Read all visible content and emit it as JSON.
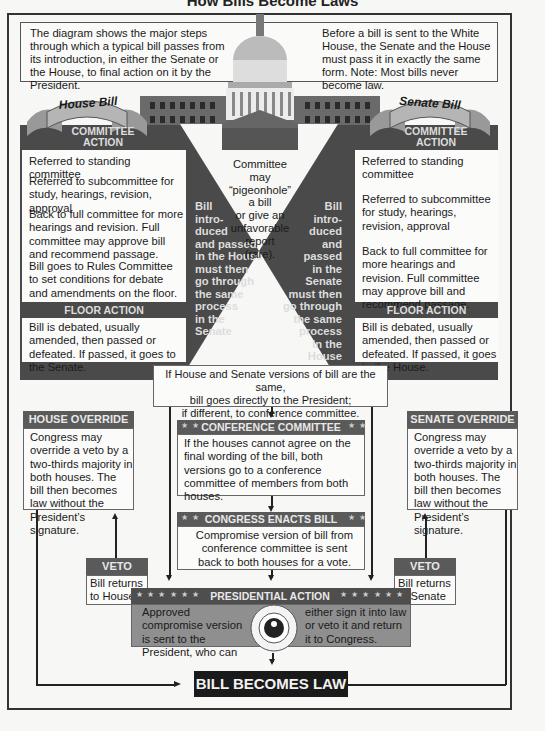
{
  "title": "How Bills Become Laws",
  "intro": {
    "left": "The diagram shows the major steps through which a typical bill passes from its introduction, in either the Senate or the House, to final action on it by the President.",
    "right": "Before a bill is sent to the White House, the Senate and the House must pass it in exactly the same form. Note: Most bills never become law."
  },
  "house": {
    "banner": "House Bill",
    "committee_header_1": "COMMITTEE",
    "committee_header_2": "ACTION",
    "steps": [
      "Referred to standing committee",
      "Referred to subcommittee for study, hearings, revision, approval",
      "Back to full committee for more hearings and revision. Full committee may approve bill and recommend passage.",
      "Bill goes to Rules Committee to set conditions for debate and amendments on the floor."
    ],
    "floor_header": "FLOOR ACTION",
    "floor_text": "Bill is debated, usually amended, then passed or defeated. If passed, it goes to the Senate.",
    "side_lines": [
      "Bill",
      "intro-",
      "duced",
      "and passed",
      "in the House",
      "must then",
      "go through",
      "the same",
      "process",
      "in the",
      "Senate"
    ]
  },
  "senate": {
    "banner": "Senate Bill",
    "committee_header_1": "COMMITTEE",
    "committee_header_2": "ACTION",
    "steps": [
      "Referred to standing committee",
      "Referred to subcommittee for study, hearings, revision, approval",
      "Back to full committee for more hearings and revision. Full committee may approve bill and recommend passage."
    ],
    "floor_header": "FLOOR ACTION",
    "floor_text": "Bill is debated, usually amended, then passed or defeated. If passed, it goes to the House.",
    "side_lines": [
      "Bill",
      "intro-",
      "duced",
      "and passed",
      "in the Senate",
      "must then",
      "go through",
      "the same",
      "process",
      "in the",
      "House"
    ]
  },
  "pigeonhole": [
    "Committee may",
    "“pigeonhole” a bill",
    "or give an",
    "unfavorable",
    "report",
    "(rare)."
  ],
  "versions_note": [
    "If House and Senate versions of bill are the same,",
    "bill goes directly to the President;",
    "if different, to conference committee."
  ],
  "conference": {
    "header": "CONFERENCE COMMITTEE",
    "stars": "★ ★",
    "text": "If the houses cannot agree on the final wording of the bill, both versions go to a conference committee of members from both houses."
  },
  "enacts": {
    "header": "CONGRESS ENACTS BILL",
    "stars": "★ ★",
    "text": "Compromise version of bill from conference committee is sent back to both houses for a vote."
  },
  "house_override": {
    "header": "HOUSE OVERRIDE",
    "text": "Congress may override a veto by a two-thirds majority in both houses. The bill then becomes law without the President’s signature."
  },
  "senate_override": {
    "header": "SENATE OVERRIDE",
    "text": "Congress may override a veto by a two-thirds majority in both houses. The bill then becomes law without the President’s signature."
  },
  "house_veto": {
    "header": "VETO",
    "text": "Bill returns to House"
  },
  "senate_veto": {
    "header": "VETO",
    "text": "Bill returns to Senate"
  },
  "presidential": {
    "header": "PRESIDENTIAL ACTION",
    "stars": "★ ★ ★ ★ ★ ★",
    "left_text": "Approved compromise version is sent to the President, who can",
    "right_text": "either sign it into law or veto it and return it to Congress.",
    "seal": "SEAL OF THE PRESIDENT OF THE UNITED STATES"
  },
  "final": "BILL BECOMES LAW",
  "colors": {
    "dark": "#4a4a4a",
    "header": "#5a5a5a",
    "presidential_bg": "#8f8f8f",
    "final_bg": "#1a1a1a"
  }
}
